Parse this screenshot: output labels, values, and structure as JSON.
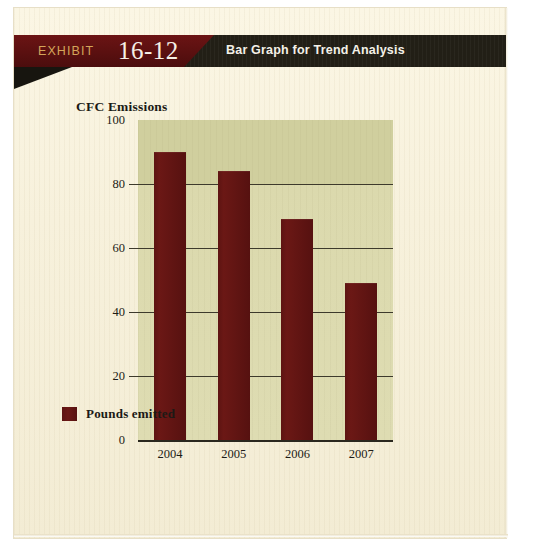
{
  "banner": {
    "exhibit_word": "EXHIBIT",
    "exhibit_number": "16-12",
    "title": "Bar Graph for Trend Analysis",
    "red_color": "#5a1010",
    "dark_color": "#221f16",
    "number_color": "#f6f1e6",
    "word_color": "#d4a55a"
  },
  "legend": {
    "label": "Pounds emitted",
    "swatch_color": "#6b1815"
  },
  "chart_data": {
    "type": "bar",
    "title": "",
    "ylabel": "CFC Emissions",
    "xlabel": "",
    "categories": [
      "2004",
      "2005",
      "2006",
      "2007"
    ],
    "values": [
      90,
      84,
      69,
      49
    ],
    "series": [
      {
        "name": "Pounds emitted",
        "values": [
          90,
          84,
          69,
          49
        ]
      }
    ],
    "ylim": [
      0,
      100
    ],
    "yticks": [
      0,
      20,
      40,
      60,
      80,
      100
    ],
    "ytick_labels": [
      "0",
      "20",
      "40",
      "60",
      "80",
      "100"
    ],
    "grid": true,
    "legend_position": "bottom-left",
    "bar_color": "#6b1815",
    "plot_background": "#d8d6ab"
  }
}
